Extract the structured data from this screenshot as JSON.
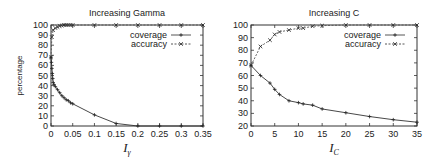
{
  "chart_data": [
    {
      "type": "line",
      "title": "Increasing Gamma",
      "xlabel": "I_γ",
      "xlabel_main": "I",
      "xlabel_sub": "γ",
      "ylabel": "percentage",
      "xlim": [
        0,
        0.35
      ],
      "ylim": [
        0,
        100
      ],
      "xticks": [
        "0",
        "0.05",
        "0.1",
        "0.15",
        "0.2",
        "0.25",
        "0.3",
        "0.35"
      ],
      "yticks": [
        "0",
        "10",
        "20",
        "30",
        "40",
        "50",
        "60",
        "70",
        "80",
        "90",
        "100"
      ],
      "grid": false,
      "legend_position": "top-right",
      "series": [
        {
          "name": "coverage",
          "style": "solid",
          "marker": "+",
          "x": [
            0,
            0.001,
            0.002,
            0.003,
            0.004,
            0.005,
            0.007,
            0.01,
            0.015,
            0.02,
            0.025,
            0.03,
            0.035,
            0.04,
            0.045,
            0.05,
            0.1,
            0.15,
            0.2,
            0.25,
            0.3,
            0.35
          ],
          "y": [
            68,
            63,
            57,
            52,
            47,
            43,
            41,
            39,
            36,
            33,
            30,
            28,
            26,
            25,
            23,
            22,
            11,
            2.5,
            0,
            0,
            0,
            0
          ]
        },
        {
          "name": "accuracy",
          "style": "dashed",
          "marker": "x",
          "x": [
            0,
            0.002,
            0.005,
            0.01,
            0.015,
            0.02,
            0.025,
            0.03,
            0.035,
            0.04,
            0.045,
            0.05,
            0.1,
            0.15,
            0.2,
            0.25,
            0.3,
            0.35
          ],
          "y": [
            68,
            88,
            95,
            97,
            98,
            99,
            99.5,
            100,
            100,
            100,
            100,
            100,
            100,
            100,
            100,
            100,
            100,
            100
          ]
        }
      ]
    },
    {
      "type": "line",
      "title": "Increasing C",
      "xlabel": "I_C",
      "xlabel_main": "I",
      "xlabel_sub": "C",
      "ylabel": "",
      "xlim": [
        0,
        35
      ],
      "ylim": [
        20,
        100
      ],
      "xticks": [
        "0",
        "5",
        "10",
        "15",
        "20",
        "25",
        "30",
        "35"
      ],
      "yticks": [
        "20",
        "30",
        "40",
        "50",
        "60",
        "70",
        "80",
        "90",
        "100"
      ],
      "grid": false,
      "legend_position": "top-right",
      "series": [
        {
          "name": "coverage",
          "style": "solid",
          "marker": "+",
          "x": [
            0,
            2,
            4,
            5,
            6,
            8,
            10,
            11,
            13,
            15,
            20,
            25,
            30,
            35
          ],
          "y": [
            68,
            60,
            54,
            49,
            45,
            40,
            38.5,
            37.5,
            36.5,
            33.5,
            30.5,
            27.5,
            25,
            23
          ]
        },
        {
          "name": "accuracy",
          "style": "dashed",
          "marker": "x",
          "x": [
            0,
            2,
            4,
            5,
            6,
            8,
            10,
            11,
            13,
            15,
            20,
            25,
            30,
            35
          ],
          "y": [
            68,
            83,
            88,
            92.5,
            94.5,
            96,
            97.5,
            97.5,
            99,
            99.5,
            100,
            100,
            100,
            100
          ]
        }
      ]
    }
  ]
}
